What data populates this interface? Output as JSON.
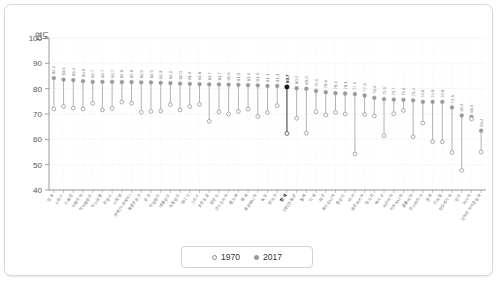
{
  "card": {
    "name": "chart-card"
  },
  "legend": {
    "items": [
      {
        "label": "1970",
        "marker": "open-circle",
        "color": "#8a8a8a"
      },
      {
        "label": "2017",
        "marker": "filled-circle",
        "color": "#9a9a9a"
      }
    ]
  },
  "chart_data": {
    "type": "scatter",
    "subtype": "dumbbell-lollipop",
    "title": "",
    "ylabel": "연도",
    "xlabel": "",
    "ylim": [
      40,
      100
    ],
    "yticks": [
      40,
      50,
      60,
      70,
      80,
      90,
      100
    ],
    "grid": true,
    "legend_position": "bottom-center",
    "highlight_category": "한국",
    "highlight_value_2017": 80.7,
    "categories": [
      "일본",
      "스위스",
      "스페인",
      "이탈리아",
      "아이슬란드",
      "이스라엘",
      "프랑스",
      "스웨덴",
      "한국(노르웨이)",
      "룩셈부르크",
      "호주",
      "아일랜드",
      "네덜란드",
      "뉴질랜드",
      "캐나다",
      "그리스",
      "포르투갈",
      "핀란드",
      "오스트리아",
      "벨기에",
      "영국",
      "슬로베니아",
      "독일",
      "덴마크",
      "한국",
      "OECD 평균",
      "칠레",
      "미국",
      "체코",
      "에스토니아",
      "폴란드",
      "터키",
      "슬로바키아",
      "헝가리",
      "멕시코",
      "라트비아",
      "리투아니아",
      "콜롬비아",
      "코스타리카",
      "중국",
      "브라질",
      "인도네시아",
      "인도",
      "러시아",
      "남아프리카공화국"
    ],
    "series": [
      {
        "name": "2017",
        "marker": "filled-circle",
        "color": "#9a9a9a",
        "values": [
          84.2,
          83.6,
          83.4,
          83.0,
          82.7,
          82.7,
          82.7,
          82.6,
          82.6,
          82.5,
          82.5,
          82.3,
          82.2,
          82.0,
          81.9,
          81.8,
          81.7,
          81.7,
          81.6,
          81.5,
          81.4,
          81.3,
          81.1,
          81.1,
          80.7,
          80.2,
          80.0,
          79.1,
          78.6,
          78.2,
          78.1,
          77.9,
          77.3,
          76.4,
          75.9,
          75.7,
          75.6,
          75.4,
          74.8,
          74.8,
          74.8,
          72.6,
          69.4,
          68.9,
          63.4
        ]
      },
      {
        "name": "1970",
        "marker": "open-circle",
        "color": "#8a8a8a",
        "values": [
          72.0,
          73.0,
          72.3,
          72.0,
          74.2,
          71.6,
          72.2,
          74.7,
          74.3,
          70.7,
          71.0,
          71.2,
          73.7,
          71.6,
          72.9,
          73.8,
          67.1,
          70.8,
          70.0,
          71.0,
          71.9,
          69.0,
          70.6,
          73.3,
          62.3,
          68.3,
          62.4,
          70.9,
          69.6,
          70.6,
          70.0,
          54.2,
          69.8,
          69.2,
          61.4,
          70.1,
          71.4,
          61.0,
          66.4,
          59.1,
          59.0,
          54.8,
          47.7,
          68.1,
          55.0
        ]
      }
    ]
  }
}
